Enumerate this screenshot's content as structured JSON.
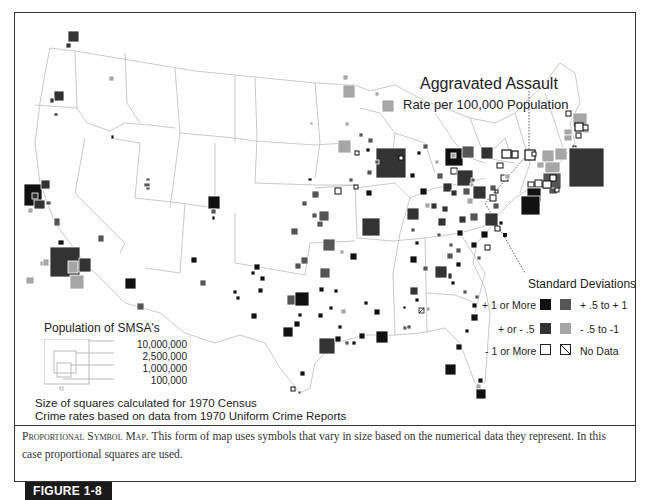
{
  "map": {
    "title": "Aggravated Assault",
    "subtitle": "Rate per 100,000 Population"
  },
  "population_legend": {
    "title": "Population of SMSA's",
    "sizes": [
      "10,000,000",
      "2,500,000",
      "1,000,000",
      "100,000"
    ]
  },
  "notes": {
    "line1": "Size of squares calculated for 1970 Census",
    "line2": "Crime rates based on data from 1970 Uniform Crime Reports"
  },
  "sd_legend": {
    "title": "Standard Deviations",
    "items": [
      {
        "label": "+ 1 or More",
        "color": "#111111"
      },
      {
        "label": "+ .5 to + 1",
        "color": "#555555"
      },
      {
        "label": "+ or - .5",
        "color": "#333333"
      },
      {
        "label": "- .5 to -1",
        "color": "#a6a6a6"
      },
      {
        "label": "- 1 or More",
        "color": "#ffffff"
      },
      {
        "label": "No Data",
        "color": "hatched"
      }
    ]
  },
  "caption": {
    "lead": "Proportional Symbol Map.",
    "text": " This form of map uses symbols that vary in size based on the numerical data they represent. In this case proportional squares are used."
  },
  "figure_label": "FIGURE 1-8"
}
